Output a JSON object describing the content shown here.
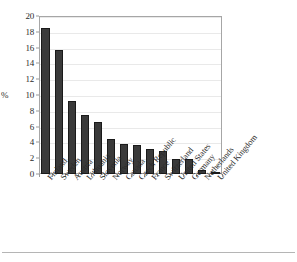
{
  "chart_data": {
    "type": "bar",
    "title": "",
    "subtitle": "",
    "xlabel": "",
    "ylabel": "%",
    "ylim": [
      0,
      20
    ],
    "ytick_step": 2,
    "yticks": [
      "0",
      "2",
      "4",
      "6",
      "8",
      "10",
      "12",
      "14",
      "16",
      "18",
      "20"
    ],
    "grid": true,
    "legend": "none",
    "bar_color": "#3a3a3a",
    "bar_edge_color": "#1a1a1a",
    "axis_color": "#a6a6a6",
    "gridline_color": "#e9e9e9",
    "categories": [
      "Finland",
      "Sweden",
      "Austria",
      "Lithuania",
      "Slovenia",
      "Norway",
      "Canada",
      "Czech Republic",
      "France",
      "Switzerland",
      "United States",
      "Germany",
      "Netherlands",
      "United Kingdom"
    ],
    "values": [
      18.5,
      15.7,
      9.3,
      7.5,
      6.6,
      4.4,
      3.8,
      3.7,
      3.2,
      2.9,
      1.9,
      1.85,
      0.45,
      0.1
    ]
  }
}
